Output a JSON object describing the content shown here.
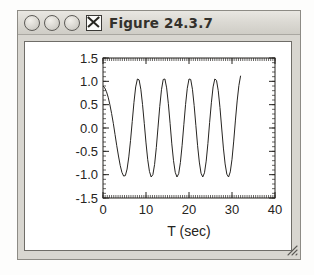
{
  "window": {
    "title": "Figure 24.3.7",
    "controls": [
      {
        "name": "minimize-circle",
        "icon": "circle-icon"
      },
      {
        "name": "zoom-circle",
        "icon": "circle-icon"
      },
      {
        "name": "maximize-circle",
        "icon": "circle-icon"
      },
      {
        "name": "close-box",
        "icon": "x-icon",
        "label": "X"
      }
    ],
    "resize_grip": "resize-grip-icon",
    "colors": {
      "titlebar": "#dcdad4",
      "frame": "#d8d6d0",
      "canvas": "#ffffff",
      "ink": "#262421"
    }
  },
  "chart_data": {
    "type": "line",
    "title": "",
    "xlabel": "T (sec)",
    "ylabel": "",
    "xlim": [
      0,
      40
    ],
    "ylim": [
      -1.5,
      1.5
    ],
    "xticks": [
      0,
      10,
      20,
      30,
      40
    ],
    "xticklabels": [
      "0",
      "10",
      "20",
      "30",
      "40"
    ],
    "yticks": [
      -1.5,
      -1.0,
      -0.5,
      0.0,
      0.5,
      1.0,
      1.5
    ],
    "yticklabels": [
      "1.5",
      "1.0",
      "0.5",
      "0.0",
      "-0.5",
      "-1.0",
      "-1.5"
    ],
    "grid": false,
    "legend": null,
    "minor_ticks": true,
    "series": [
      {
        "name": "oscillation",
        "color": "#262421",
        "description": "damped-onset sinusoid, period about 5.2 sec, amplitude about 1.05",
        "x": [
          0.0,
          0.4,
          0.8,
          1.2,
          1.6,
          2.0,
          2.4,
          2.8,
          3.2,
          3.6,
          4.0,
          4.4,
          4.8,
          5.2,
          5.6,
          6.0,
          6.4,
          6.8,
          7.2,
          7.6,
          8.0,
          8.4,
          8.8,
          9.2,
          9.6,
          10.0,
          10.4,
          10.8,
          11.2,
          11.6,
          12.0,
          12.4,
          12.8,
          13.2,
          13.6,
          14.0,
          14.4,
          14.8,
          15.2,
          15.6,
          16.0,
          16.4,
          16.8,
          17.2,
          17.6,
          18.0,
          18.4,
          18.8,
          19.2,
          19.6,
          20.0,
          20.4,
          20.8,
          21.2,
          21.6,
          22.0,
          22.4,
          22.8,
          23.2,
          23.6,
          24.0,
          24.4,
          24.8,
          25.2,
          25.6,
          26.0,
          26.4,
          26.8,
          27.2,
          27.6,
          28.0,
          28.4,
          28.8,
          29.2,
          29.6,
          30.0,
          30.4,
          30.8,
          31.2,
          31.6,
          32.0
        ],
        "y": [
          0.9,
          0.86,
          0.78,
          0.66,
          0.5,
          0.31,
          0.1,
          -0.14,
          -0.38,
          -0.6,
          -0.8,
          -0.95,
          -1.03,
          -1.02,
          -0.88,
          -0.62,
          -0.27,
          0.14,
          0.55,
          0.88,
          1.05,
          1.03,
          0.83,
          0.5,
          0.1,
          -0.32,
          -0.68,
          -0.93,
          -1.05,
          -1.0,
          -0.78,
          -0.42,
          0.02,
          0.46,
          0.82,
          1.04,
          1.05,
          0.86,
          0.52,
          0.1,
          -0.34,
          -0.7,
          -0.95,
          -1.05,
          -0.98,
          -0.74,
          -0.37,
          0.07,
          0.5,
          0.85,
          1.05,
          1.04,
          0.83,
          0.48,
          0.05,
          -0.38,
          -0.73,
          -0.97,
          -1.05,
          -0.96,
          -0.71,
          -0.33,
          0.12,
          0.54,
          0.88,
          1.05,
          1.02,
          0.8,
          0.44,
          0.0,
          -0.43,
          -0.77,
          -0.99,
          -1.05,
          -0.94,
          -0.67,
          -0.28,
          0.17,
          0.58,
          0.91,
          1.12
        ]
      }
    ]
  }
}
